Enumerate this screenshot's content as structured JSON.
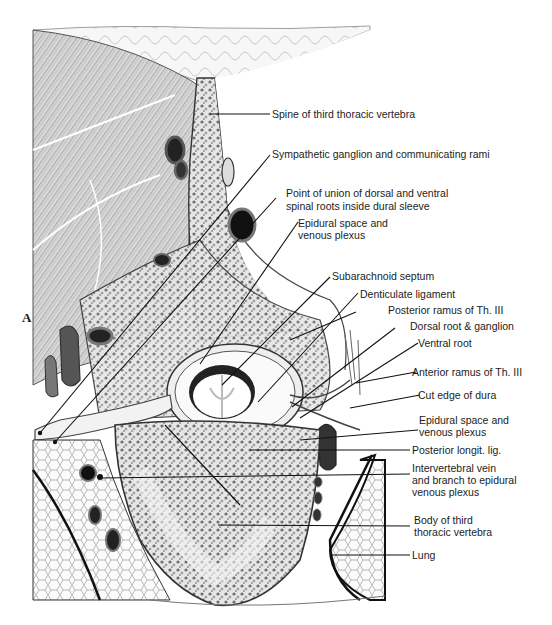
{
  "figure": {
    "panel_letter": "A"
  },
  "labels": [
    {
      "id": "spine",
      "text": "Spine of third thoracic vertebra"
    },
    {
      "id": "sympathetic",
      "text": "Sympathetic ganglion and communicating rami"
    },
    {
      "id": "union_1",
      "text": "Point of union of dorsal and ventral"
    },
    {
      "id": "union_2",
      "text": "spinal roots inside dural sleeve"
    },
    {
      "id": "epidural_top_1",
      "text": "Epidural space and"
    },
    {
      "id": "epidural_top_2",
      "text": "venous plexus"
    },
    {
      "id": "subarachnoid",
      "text": "Subarachnoid septum"
    },
    {
      "id": "denticulate",
      "text": "Denticulate ligament"
    },
    {
      "id": "posterior_ramus",
      "text": "Posterior ramus of Th. III"
    },
    {
      "id": "dorsal_root",
      "text": "Dorsal root & ganglion"
    },
    {
      "id": "ventral_root",
      "text": "Ventral root"
    },
    {
      "id": "anterior_ramus",
      "text": "Anterior ramus of Th. III"
    },
    {
      "id": "cut_dura",
      "text": "Cut edge of dura"
    },
    {
      "id": "epidural_bot_1",
      "text": "Epidural space and"
    },
    {
      "id": "epidural_bot_2",
      "text": "venous plexus"
    },
    {
      "id": "post_longit",
      "text": "Posterior longit. lig."
    },
    {
      "id": "interv_1",
      "text": "Intervertebral vein"
    },
    {
      "id": "interv_2",
      "text": "and branch to epidural"
    },
    {
      "id": "interv_3",
      "text": "venous plexus"
    },
    {
      "id": "body_1",
      "text": "Body of third"
    },
    {
      "id": "body_2",
      "text": "thoracic vertebra"
    },
    {
      "id": "lung",
      "text": "Lung"
    }
  ]
}
